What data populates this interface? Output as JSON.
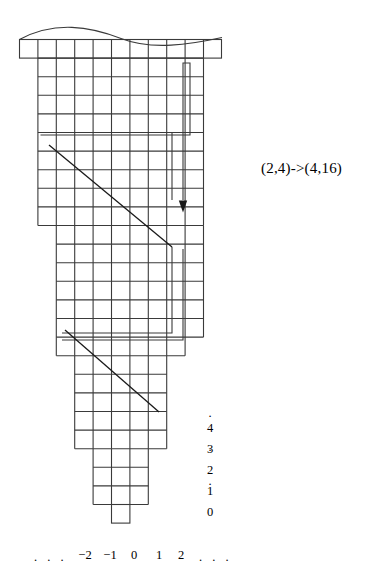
{
  "figure": {
    "name": "pairing-function-grid-diagram",
    "stroke_color": "#3a3a3a",
    "background_color": "#ffffff",
    "annotation": {
      "label": "(2,4)->(4,16)"
    },
    "x_axis": {
      "left_ellipsis": ". . .",
      "ticks": [
        "−2",
        "−1",
        "0",
        "1",
        "2"
      ],
      "right_ellipsis": ". . ."
    },
    "y_axis": {
      "top_ellipsis": [
        ".",
        ".",
        "."
      ],
      "ticks": [
        "4",
        "3",
        "2",
        "1",
        "0"
      ]
    },
    "grid": {
      "cell_width": 18.4,
      "cell_height": 18.6,
      "tiers": [
        {
          "name": "tier-top-cap",
          "cols": 11,
          "rows": 1
        },
        {
          "name": "tier-1",
          "cols": 9,
          "rows": 10
        },
        {
          "name": "tier-2",
          "cols": 8,
          "rows": 6
        },
        {
          "name": "tier-3",
          "cols": 7,
          "rows": 1
        },
        {
          "name": "tier-4",
          "cols": 5,
          "rows": 4
        },
        {
          "name": "tier-5",
          "cols": 3,
          "rows": 3
        },
        {
          "name": "tier-6",
          "cols": 1,
          "rows": 1
        }
      ]
    },
    "paths": {
      "snake_arrow": "down-arrow-head",
      "diagonals": 2
    }
  }
}
